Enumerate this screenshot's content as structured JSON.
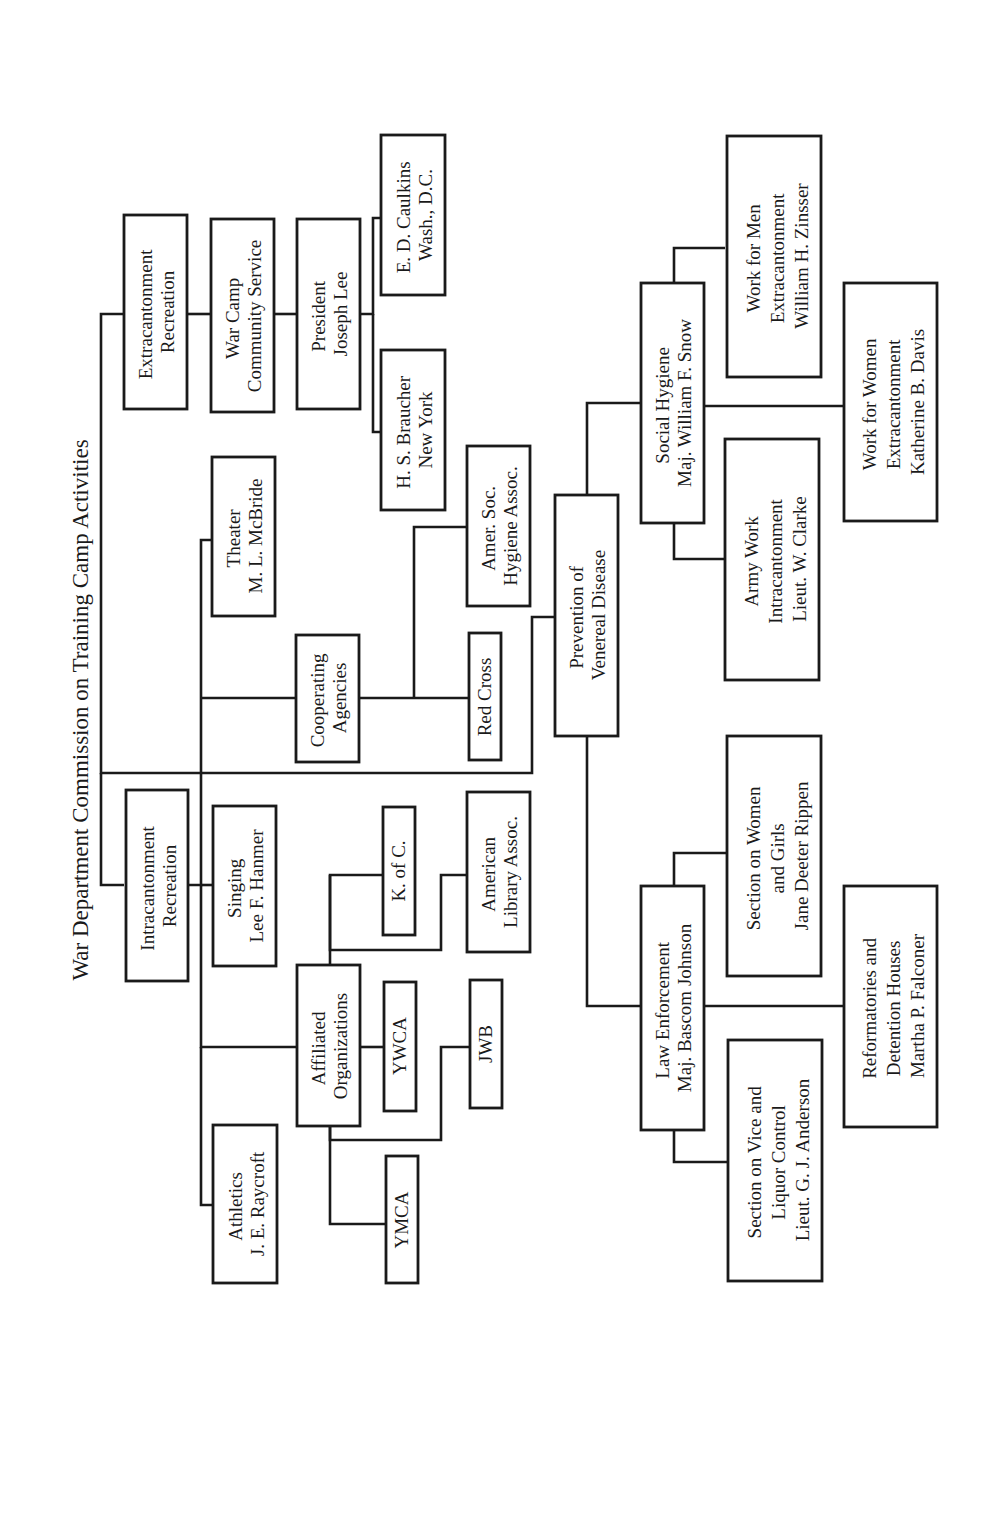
{
  "title": "War Department Commission on Training Camp Activities",
  "orientation": "rotated-90-ccw",
  "colors": {
    "ink": "#1a1a1a",
    "paper": "#ffffff"
  },
  "nodes": {
    "extracantonment": {
      "lines": [
        "Extracantonment",
        "Recreation"
      ]
    },
    "war_camp": {
      "lines": [
        "War Camp",
        "Community Service"
      ]
    },
    "president": {
      "lines": [
        "President",
        "Joseph Lee"
      ]
    },
    "caulkins": {
      "lines": [
        "E. D. Caulkins",
        "Wash., D.C."
      ]
    },
    "braucher": {
      "lines": [
        "H. S. Braucher",
        "New York"
      ]
    },
    "theater": {
      "lines": [
        "Theater",
        "M. L. McBride"
      ]
    },
    "cooperating": {
      "lines": [
        "Cooperating",
        "Agencies"
      ]
    },
    "amer_soc": {
      "lines": [
        "Amer. Soc.",
        "Hygiene Assoc."
      ]
    },
    "red_cross": {
      "lines": [
        "Red Cross"
      ]
    },
    "intracantonment": {
      "lines": [
        "Intracantonment",
        "Recreation"
      ]
    },
    "singing": {
      "lines": [
        "Singing",
        "Lee F. Hanmer"
      ]
    },
    "k_of_c": {
      "lines": [
        "K. of C."
      ]
    },
    "ala": {
      "lines": [
        "American",
        "Library Assoc."
      ]
    },
    "affiliated": {
      "lines": [
        "Affiliated",
        "Organizations"
      ]
    },
    "ywca": {
      "lines": [
        "YWCA"
      ]
    },
    "jwb": {
      "lines": [
        "JWB"
      ]
    },
    "ymca": {
      "lines": [
        "YMCA"
      ]
    },
    "athletics": {
      "lines": [
        "Athletics",
        "J. E. Raycroft"
      ]
    },
    "prevention": {
      "lines": [
        "Prevention of",
        "Venereal Disease"
      ]
    },
    "social_hygiene": {
      "lines": [
        "Social Hygiene",
        "Maj. William F. Snow"
      ]
    },
    "work_men": {
      "lines": [
        "Work for Men",
        "Extracantonment",
        "William H. Zinsser"
      ]
    },
    "work_women": {
      "lines": [
        "Work for Women",
        "Extracantonment",
        "Katherine B. Davis"
      ]
    },
    "army_work": {
      "lines": [
        "Army Work",
        "Intracantonment",
        "Lieut. W. Clarke"
      ]
    },
    "law_enforcement": {
      "lines": [
        "Law Enforcement",
        "Maj. Bascom Johnson"
      ]
    },
    "women_girls": {
      "lines": [
        "Section on Women",
        "and Girls",
        "Jane Deeter Rippen"
      ]
    },
    "reformatories": {
      "lines": [
        "Reformatories and",
        "Detention Houses",
        "Martha P. Falconer"
      ]
    },
    "vice_liquor": {
      "lines": [
        "Section on Vice and",
        "Liquor Control",
        "Lieut. G. J. Anderson"
      ]
    }
  }
}
